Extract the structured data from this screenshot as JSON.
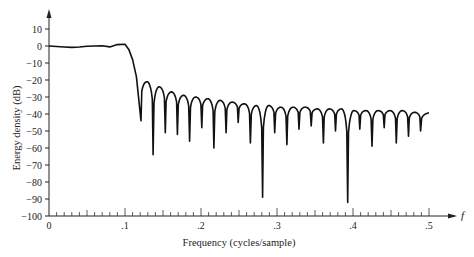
{
  "chart_data": {
    "type": "line",
    "title": "",
    "xlabel": "Frequency (cycles/sample)",
    "ylabel": "Energy density (dB)",
    "x_axis_symbol": "f",
    "xlim": [
      0,
      0.5
    ],
    "ylim": [
      -100,
      10
    ],
    "x_ticks": [
      0,
      0.1,
      0.2,
      0.3,
      0.4,
      0.5
    ],
    "x_tick_labels": [
      "0",
      ".1",
      ".2",
      ".3",
      ".4",
      ".5"
    ],
    "x_minor_tick_step": 0.01,
    "y_ticks": [
      10,
      0,
      -10,
      -20,
      -30,
      -40,
      -50,
      -60,
      -70,
      -80,
      -90,
      -100
    ],
    "y_tick_labels": [
      "10",
      "0",
      "−10",
      "−20",
      "−30",
      "−40",
      "−50",
      "−60",
      "−70",
      "−80",
      "−90",
      "−100"
    ],
    "grid": false,
    "series": [
      {
        "name": "Energy density",
        "passband": {
          "x": [
            0,
            0.01,
            0.02,
            0.03,
            0.04,
            0.05,
            0.06,
            0.07,
            0.08,
            0.09,
            0.1,
            0.105,
            0.11,
            0.115,
            0.121
          ],
          "y": [
            0,
            -0.3,
            -0.6,
            -0.8,
            -0.6,
            -0.2,
            0,
            0.1,
            -0.5,
            0.8,
            1,
            -2,
            -8,
            -18,
            -44
          ]
        },
        "sidelobes": {
          "nulls_x": [
            0.121,
            0.137,
            0.153,
            0.169,
            0.185,
            0.201,
            0.217,
            0.233,
            0.249,
            0.265,
            0.281,
            0.297,
            0.313,
            0.329,
            0.345,
            0.361,
            0.377,
            0.393,
            0.409,
            0.425,
            0.441,
            0.457,
            0.473,
            0.489
          ],
          "nulls_y": [
            -44,
            -64,
            -51,
            -52,
            -56,
            -48,
            -60,
            -51,
            -45,
            -57,
            -89,
            -51,
            -58,
            -49,
            -47,
            -57,
            -50,
            -92,
            -49,
            -59,
            -48,
            -57,
            -53,
            -50
          ],
          "peaks_y": [
            -21,
            -24,
            -27,
            -29,
            -30,
            -31,
            -32,
            -33,
            -34,
            -35,
            -35,
            -36,
            -36,
            -36,
            -37,
            -37,
            -37,
            -38,
            -38,
            -38,
            -38,
            -38,
            -39,
            -39
          ],
          "end": {
            "x": 0.5,
            "y": -40
          }
        }
      }
    ]
  }
}
